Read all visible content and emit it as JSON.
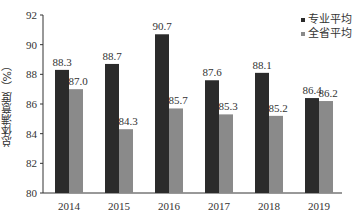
{
  "chart_data": {
    "type": "bar",
    "title": "",
    "xlabel": "",
    "ylabel": "总体满意度（%）",
    "categories": [
      "2014",
      "2015",
      "2016",
      "2017",
      "2018",
      "2019"
    ],
    "series": [
      {
        "name": "专业平均",
        "color": "#2b2b2b",
        "values": [
          88.3,
          88.7,
          90.7,
          87.6,
          88.1,
          86.4
        ]
      },
      {
        "name": "全省平均",
        "color": "#8a8a8a",
        "values": [
          87.0,
          84.3,
          85.7,
          85.3,
          85.2,
          86.2
        ]
      }
    ],
    "ylim": [
      80,
      92
    ],
    "yticks": [
      80,
      82,
      84,
      86,
      88,
      90,
      92
    ],
    "grid": false,
    "legend_position": "top-right",
    "data_labels": true
  }
}
